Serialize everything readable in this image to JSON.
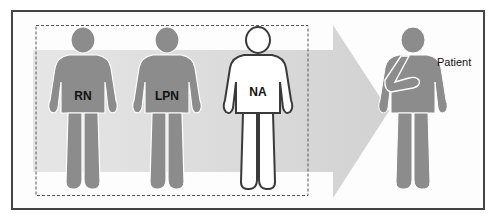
{
  "diagram": {
    "caption": "",
    "colors": {
      "frame_border": "#444444",
      "arrow_fill": "#d8d8d8",
      "figure_fill": "#8c8c8c",
      "figure_outline": "#ffffff",
      "na_fill": "#ffffff",
      "na_outline": "#3a3a3a",
      "dashed_box": "#555555"
    },
    "care_team": {
      "group_label": "",
      "members": [
        {
          "label": "RN",
          "style": "filled"
        },
        {
          "label": "LPN",
          "style": "filled"
        },
        {
          "label": "NA",
          "style": "outline"
        }
      ]
    },
    "arrow": {
      "direction": "right"
    },
    "recipient": {
      "label": "Patient",
      "detail": "arm in sling"
    }
  }
}
